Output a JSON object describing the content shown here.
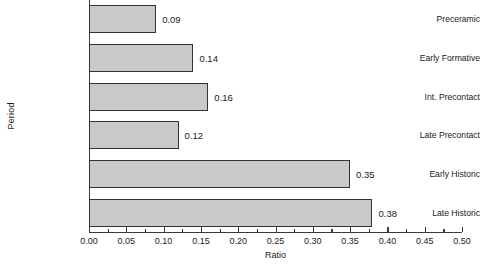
{
  "chart_data": {
    "type": "bar",
    "orientation": "horizontal",
    "title": "",
    "xlabel": "Ratio",
    "ylabel": "Period",
    "categories": [
      "Preceramic",
      "Early Formative",
      "Int. Precontact",
      "Late Precontact",
      "Early Historic",
      "Late Historic"
    ],
    "values": [
      0.09,
      0.14,
      0.16,
      0.12,
      0.35,
      0.38
    ],
    "value_labels": [
      "0.09",
      "0.14",
      "0.16",
      "0.12",
      "0.35",
      "0.38"
    ],
    "xlim": [
      0.0,
      0.5
    ],
    "ylim": null,
    "xticks": [
      0.0,
      0.05,
      0.1,
      0.15,
      0.2,
      0.25,
      0.3,
      0.35,
      0.4,
      0.45,
      0.5
    ],
    "xtick_labels": [
      "0.00",
      "0.05",
      "0.10",
      "0.15",
      "0.20",
      "0.25",
      "0.30",
      "0.35",
      "0.40",
      "0.45",
      "0.50"
    ],
    "minor_tick_interval": 0.025,
    "grid": false,
    "legend": null,
    "bar_fill_color": "#c9c9c9",
    "bar_edge_color": "#333333",
    "axis_color": "#3a3a3a",
    "background_color": "#ffffff"
  }
}
